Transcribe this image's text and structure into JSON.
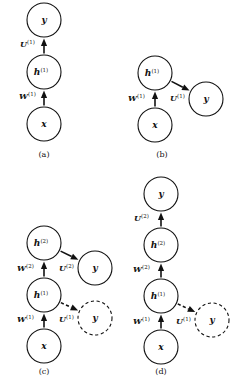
{
  "figure": {
    "background_color": "#ffffff",
    "stroke_color": "#111111",
    "width": 235,
    "height": 390
  },
  "panels": [
    {
      "id": "a",
      "caption": "(a)",
      "caption_x": 44,
      "caption_y": 157,
      "nodes": [
        {
          "name": "y-node",
          "label": "y",
          "sup": "",
          "cx": 44,
          "cy": 20,
          "r": 17,
          "style": "solid"
        },
        {
          "name": "h1-node",
          "label": "h",
          "sup": "(1)",
          "cx": 44,
          "cy": 72,
          "r": 17,
          "style": "solid"
        },
        {
          "name": "x-node",
          "label": "x",
          "sup": "",
          "cx": 44,
          "cy": 124,
          "r": 17,
          "style": "solid"
        }
      ],
      "edges": [
        {
          "name": "edge-h1-to-y",
          "from": "h1-node",
          "to": "y-node",
          "label": "U",
          "sup": "(1)",
          "label_x": 20,
          "label_y": 47,
          "style": "solid"
        },
        {
          "name": "edge-x-to-h1",
          "from": "x-node",
          "to": "h1-node",
          "label": "W",
          "sup": "(1)",
          "label_x": 19,
          "label_y": 99,
          "style": "solid"
        }
      ]
    },
    {
      "id": "b",
      "caption": "(b)",
      "caption_x": 162,
      "caption_y": 157,
      "nodes": [
        {
          "name": "h1-node",
          "label": "h",
          "sup": "(1)",
          "cx": 155,
          "cy": 73,
          "r": 17,
          "style": "solid"
        },
        {
          "name": "y-node",
          "label": "y",
          "sup": "",
          "cx": 206,
          "cy": 99,
          "r": 17,
          "style": "solid"
        },
        {
          "name": "x-node",
          "label": "x",
          "sup": "",
          "cx": 155,
          "cy": 125,
          "r": 17,
          "style": "solid"
        }
      ],
      "edges": [
        {
          "name": "edge-h1-to-y",
          "from": "h1-node",
          "to": "y-node",
          "label": "U",
          "sup": "(1)",
          "label_x": 170,
          "label_y": 101,
          "style": "solid"
        },
        {
          "name": "edge-x-to-h1",
          "from": "x-node",
          "to": "h1-node",
          "label": "W",
          "sup": "(1)",
          "label_x": 128,
          "label_y": 101,
          "style": "solid"
        }
      ]
    },
    {
      "id": "c",
      "caption": "(c)",
      "caption_x": 44,
      "caption_y": 374,
      "nodes": [
        {
          "name": "h2-node",
          "label": "h",
          "sup": "(2)",
          "cx": 44,
          "cy": 243,
          "r": 17,
          "style": "solid"
        },
        {
          "name": "y-node",
          "label": "y",
          "sup": "",
          "cx": 95,
          "cy": 268,
          "r": 17,
          "style": "solid"
        },
        {
          "name": "h1-node",
          "label": "h",
          "sup": "(1)",
          "cx": 44,
          "cy": 295,
          "r": 17,
          "style": "solid"
        },
        {
          "name": "y-dashed-node",
          "label": "y",
          "sup": "",
          "cx": 95,
          "cy": 318,
          "r": 17,
          "style": "dashed"
        },
        {
          "name": "x-node",
          "label": "x",
          "sup": "",
          "cx": 44,
          "cy": 346,
          "r": 17,
          "style": "solid"
        }
      ],
      "edges": [
        {
          "name": "edge-h2-to-y",
          "from": "h2-node",
          "to": "y-node",
          "label": "U",
          "sup": "(2)",
          "label_x": 59,
          "label_y": 271,
          "style": "solid"
        },
        {
          "name": "edge-h1-to-h2",
          "from": "h1-node",
          "to": "h2-node",
          "label": "W",
          "sup": "(2)",
          "label_x": 17,
          "label_y": 271,
          "style": "solid"
        },
        {
          "name": "edge-h1-to-y-dashed",
          "from": "h1-node",
          "to": "y-dashed-node",
          "label": "U",
          "sup": "(1)",
          "label_x": 59,
          "label_y": 322,
          "style": "dashed"
        },
        {
          "name": "edge-x-to-h1",
          "from": "x-node",
          "to": "h1-node",
          "label": "W",
          "sup": "(1)",
          "label_x": 17,
          "label_y": 322,
          "style": "solid"
        }
      ]
    },
    {
      "id": "d",
      "caption": "(d)",
      "caption_x": 161,
      "caption_y": 374,
      "nodes": [
        {
          "name": "y-node",
          "label": "y",
          "sup": "",
          "cx": 161,
          "cy": 194,
          "r": 17,
          "style": "solid"
        },
        {
          "name": "h2-node",
          "label": "h",
          "sup": "(2)",
          "cx": 161,
          "cy": 245,
          "r": 17,
          "style": "solid"
        },
        {
          "name": "h1-node",
          "label": "h",
          "sup": "(1)",
          "cx": 161,
          "cy": 296,
          "r": 17,
          "style": "solid"
        },
        {
          "name": "y-dashed-node",
          "label": "y",
          "sup": "",
          "cx": 212,
          "cy": 320,
          "r": 17,
          "style": "dashed"
        },
        {
          "name": "x-node",
          "label": "x",
          "sup": "",
          "cx": 161,
          "cy": 347,
          "r": 17,
          "style": "solid"
        }
      ],
      "edges": [
        {
          "name": "edge-h2-to-y",
          "from": "h2-node",
          "to": "y-node",
          "label": "U",
          "sup": "(2)",
          "label_x": 134,
          "label_y": 221,
          "style": "solid"
        },
        {
          "name": "edge-h1-to-h2",
          "from": "h1-node",
          "to": "h2-node",
          "label": "W",
          "sup": "(2)",
          "label_x": 133,
          "label_y": 272,
          "style": "solid"
        },
        {
          "name": "edge-h1-to-y-dashed",
          "from": "h1-node",
          "to": "y-dashed-node",
          "label": "U",
          "sup": "(1)",
          "label_x": 176,
          "label_y": 324,
          "style": "dashed"
        },
        {
          "name": "edge-x-to-h1",
          "from": "x-node",
          "to": "h1-node",
          "label": "W",
          "sup": "(1)",
          "label_x": 133,
          "label_y": 324,
          "style": "solid"
        }
      ]
    }
  ]
}
